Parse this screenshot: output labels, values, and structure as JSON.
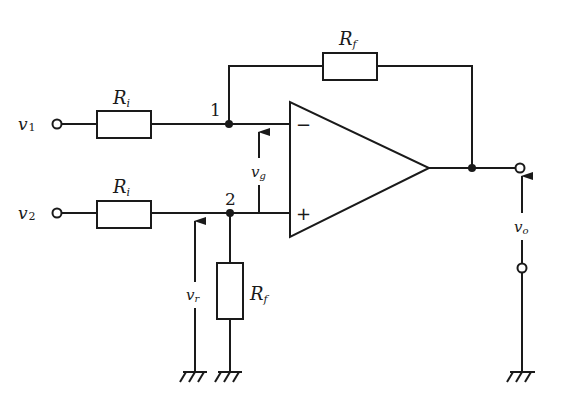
{
  "diagram": {
    "type": "circuit-schematic",
    "inputs": {
      "v1": {
        "name": "v",
        "sub": "1"
      },
      "v2": {
        "name": "v",
        "sub": "2"
      }
    },
    "resistors": {
      "ri_top": {
        "name": "R",
        "sub": "i"
      },
      "ri_bottom": {
        "name": "R",
        "sub": "i"
      },
      "rf_feedback": {
        "name": "R",
        "sub": "f"
      },
      "rf_ground": {
        "name": "R",
        "sub": "f"
      }
    },
    "nodes": {
      "node1": "1",
      "node2": "2"
    },
    "opamp": {
      "inverting": "−",
      "non_inverting": "+"
    },
    "voltages": {
      "vg": {
        "name": "v",
        "sub": "g"
      },
      "vr": {
        "name": "v",
        "sub": "r"
      },
      "vo": {
        "name": "v",
        "sub": "o"
      }
    }
  }
}
